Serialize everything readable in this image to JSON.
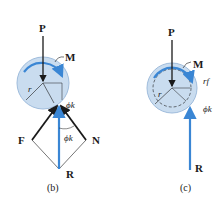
{
  "figure_b": {
    "caption": "(b)",
    "labels": {
      "P": "P",
      "M": "M",
      "F": "F",
      "N": "N",
      "R": "R",
      "r": "r",
      "phi_k": "ϕk",
      "phi_k_lower": "ϕk"
    }
  },
  "figure_c": {
    "caption": "(c)",
    "labels": {
      "P": "P",
      "M": "M",
      "R": "R",
      "r": "r",
      "r_f": "rf",
      "phi_k": "ϕk"
    }
  },
  "colors": {
    "disc_fill": "#c9dcef",
    "disc_stroke": "#9fbcdc",
    "accent_blue": "#3a86d4",
    "force_black": "#1a1a1a"
  }
}
